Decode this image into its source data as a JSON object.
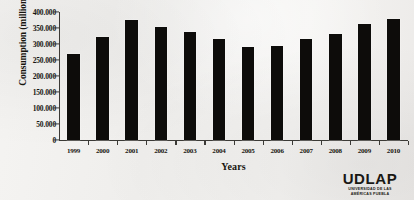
{
  "chart_data": {
    "type": "bar",
    "title": "",
    "xlabel": "Years",
    "ylabel": "Consumption (millions of ft³)",
    "ylabel_prefix": "Consumption (millions of ft",
    "ylabel_sup": "3",
    "ylabel_suffix": ")",
    "categories": [
      "1999",
      "2000",
      "2001",
      "2002",
      "2003",
      "2004",
      "2005",
      "2006",
      "2007",
      "2008",
      "2009",
      "2010"
    ],
    "values": [
      268000,
      322000,
      375000,
      352000,
      337000,
      315000,
      290000,
      293000,
      315000,
      330000,
      362000,
      378000
    ],
    "ylim": [
      0,
      400000
    ],
    "ytick_values": [
      0,
      50000,
      100000,
      150000,
      200000,
      250000,
      300000,
      350000,
      400000
    ],
    "ytick_labels": [
      "0",
      "50.000",
      "100.000",
      "150.000",
      "200.000",
      "250.000",
      "300.000",
      "350.000",
      "400.000"
    ],
    "grid": false,
    "legend": null,
    "bar_color": "#0d0c0a",
    "axis_color": "#3b3a36",
    "background_color": "#f2f1ef"
  },
  "logo": {
    "wordmark": "UDLAP",
    "subtitle_line1": "UNIVERSIDAD DE LAS",
    "subtitle_line2": "AMÉRICAS PUEBLA"
  }
}
